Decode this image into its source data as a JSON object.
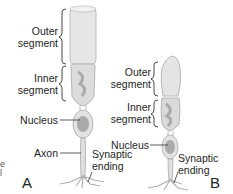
{
  "diagram": {
    "panels": [
      {
        "id": "A",
        "label": "A",
        "cell": "rod",
        "labels": {
          "outer_line1": "Outer",
          "outer_line2": "segment",
          "inner_line1": "Inner",
          "inner_line2": "segment",
          "nucleus": "Nucleus",
          "axon": "Axon",
          "synaptic_line1": "Synaptic",
          "synaptic_line2": "ending"
        }
      },
      {
        "id": "B",
        "label": "B",
        "cell": "cone",
        "labels": {
          "outer_line1": "Outer",
          "outer_line2": "segment",
          "inner_line1": "Inner",
          "inner_line2": "segment",
          "nucleus": "Nucleus",
          "synaptic_line1": "Synaptic",
          "synaptic_line2": "ending"
        }
      }
    ],
    "edge_fragment": {
      "line1": "e",
      "line2": "l"
    },
    "colors": {
      "cell_fill": "#e6e6e6",
      "cell_stroke": "#a8a8a8",
      "inner_texture": "#8a8a8a",
      "nucleus_fill": "#9c9c9c",
      "bracket": "#333333"
    }
  }
}
